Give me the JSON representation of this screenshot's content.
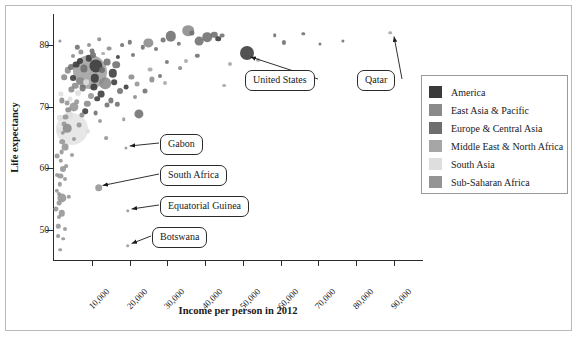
{
  "chart_data": {
    "type": "scatter",
    "title": "",
    "xlabel": "Income per person in 2012",
    "ylabel": "Life expectancy",
    "xlim": [
      0,
      98000
    ],
    "ylim": [
      45,
      85
    ],
    "xticks": [
      "10,000",
      "20,000",
      "30,000",
      "40,000",
      "50,000",
      "60,000",
      "70,000",
      "80,000",
      "90,000"
    ],
    "xtickvalues": [
      10000,
      20000,
      30000,
      40000,
      50000,
      60000,
      70000,
      80000,
      90000
    ],
    "yticks": [
      "50",
      "60",
      "70",
      "80"
    ],
    "ytickvalues": [
      50,
      60,
      70,
      80
    ],
    "grid": false,
    "legend_position": "right",
    "bubble_note": "marker area encodes population",
    "series": [
      {
        "name": "America",
        "color": "#3a3a3a"
      },
      {
        "name": "East Asia & Pacific",
        "color": "#8a8a8a"
      },
      {
        "name": "Europe & Central Asia",
        "color": "#6e6e6e"
      },
      {
        "name": "Middle East & North Africa",
        "color": "#a6a6a6"
      },
      {
        "name": "South Asia",
        "color": "#dedede"
      },
      {
        "name": "Sub-Saharan Africa",
        "color": "#949494"
      }
    ],
    "annotations": [
      {
        "label": "United States",
        "x": 51000,
        "y": 78.7
      },
      {
        "label": "Qatar",
        "x": 89000,
        "y": 82.0
      },
      {
        "label": "Gabon",
        "x": 19000,
        "y": 63.3
      },
      {
        "label": "South Africa",
        "x": 11800,
        "y": 56.9
      },
      {
        "label": "Equatorial Guinea",
        "x": 19500,
        "y": 53.1
      },
      {
        "label": "Botswana",
        "x": 19500,
        "y": 47.5
      }
    ],
    "points": [
      {
        "x": 51000,
        "y": 78.7,
        "r": 7.0,
        "s": 0
      },
      {
        "x": 89000,
        "y": 82.0,
        "r": 1.8,
        "s": 3
      },
      {
        "x": 19000,
        "y": 63.3,
        "r": 1.6,
        "s": 5
      },
      {
        "x": 11800,
        "y": 56.9,
        "r": 3.8,
        "s": 5
      },
      {
        "x": 19500,
        "y": 53.1,
        "r": 1.7,
        "s": 5
      },
      {
        "x": 19500,
        "y": 47.5,
        "r": 1.8,
        "s": 5
      },
      {
        "x": 9500,
        "y": 75.6,
        "r": 17.0,
        "s": 1
      },
      {
        "x": 4800,
        "y": 66.3,
        "r": 16.0,
        "s": 4
      },
      {
        "x": 11200,
        "y": 76.6,
        "r": 6.6,
        "s": 0
      },
      {
        "x": 5200,
        "y": 70.0,
        "r": 4.6,
        "s": 5
      },
      {
        "x": 3500,
        "y": 66.5,
        "r": 4.3,
        "s": 1
      },
      {
        "x": 4100,
        "y": 68.7,
        "r": 4.0,
        "s": 4
      },
      {
        "x": 22500,
        "y": 68.8,
        "r": 4.6,
        "s": 2
      },
      {
        "x": 2900,
        "y": 63.5,
        "r": 3.4,
        "s": 5
      },
      {
        "x": 2300,
        "y": 59.9,
        "r": 3.0,
        "s": 5
      },
      {
        "x": 2100,
        "y": 55.2,
        "r": 4.6,
        "s": 5
      },
      {
        "x": 2000,
        "y": 52.7,
        "r": 3.2,
        "s": 5
      },
      {
        "x": 13500,
        "y": 73.8,
        "r": 5.8,
        "s": 1
      },
      {
        "x": 15500,
        "y": 75.4,
        "r": 4.2,
        "s": 0
      },
      {
        "x": 16500,
        "y": 76.8,
        "r": 3.8,
        "s": 2
      },
      {
        "x": 25000,
        "y": 80.3,
        "r": 4.6,
        "s": 1
      },
      {
        "x": 31000,
        "y": 81.4,
        "r": 5.2,
        "s": 2
      },
      {
        "x": 35500,
        "y": 82.3,
        "r": 5.8,
        "s": 1
      },
      {
        "x": 38500,
        "y": 80.6,
        "r": 4.4,
        "s": 2
      },
      {
        "x": 40500,
        "y": 81.2,
        "r": 4.8,
        "s": 2
      },
      {
        "x": 42500,
        "y": 81.6,
        "r": 3.2,
        "s": 2
      },
      {
        "x": 43500,
        "y": 81.0,
        "r": 2.8,
        "s": 0
      },
      {
        "x": 44500,
        "y": 81.5,
        "r": 2.4,
        "s": 2
      },
      {
        "x": 36500,
        "y": 81.9,
        "r": 2.6,
        "s": 2
      },
      {
        "x": 33000,
        "y": 80.2,
        "r": 2.2,
        "s": 2
      },
      {
        "x": 29000,
        "y": 80.8,
        "r": 2.4,
        "s": 2
      },
      {
        "x": 27000,
        "y": 79.4,
        "r": 2.0,
        "s": 2
      },
      {
        "x": 23500,
        "y": 79.6,
        "r": 2.2,
        "s": 2
      },
      {
        "x": 21000,
        "y": 78.4,
        "r": 2.0,
        "s": 2
      },
      {
        "x": 20000,
        "y": 80.4,
        "r": 2.2,
        "s": 2
      },
      {
        "x": 18000,
        "y": 79.9,
        "r": 1.9,
        "s": 2
      },
      {
        "x": 17000,
        "y": 78.0,
        "r": 2.1,
        "s": 0
      },
      {
        "x": 14500,
        "y": 79.4,
        "r": 2.4,
        "s": 1
      },
      {
        "x": 13000,
        "y": 78.6,
        "r": 1.9,
        "s": 3
      },
      {
        "x": 12000,
        "y": 80.9,
        "r": 1.8,
        "s": 1
      },
      {
        "x": 1600,
        "y": 80.7,
        "r": 1.6,
        "s": 1
      },
      {
        "x": 61000,
        "y": 80.4,
        "r": 2.1,
        "s": 2
      },
      {
        "x": 58500,
        "y": 81.6,
        "r": 1.8,
        "s": 2
      },
      {
        "x": 66000,
        "y": 81.8,
        "r": 1.7,
        "s": 2
      },
      {
        "x": 54000,
        "y": 77.6,
        "r": 2.0,
        "s": 3
      },
      {
        "x": 53000,
        "y": 74.9,
        "r": 1.8,
        "s": 3
      },
      {
        "x": 70500,
        "y": 80.2,
        "r": 1.6,
        "s": 2
      },
      {
        "x": 76500,
        "y": 80.6,
        "r": 1.6,
        "s": 2
      },
      {
        "x": 46500,
        "y": 76.9,
        "r": 2.0,
        "s": 3
      },
      {
        "x": 38000,
        "y": 78.2,
        "r": 2.2,
        "s": 2
      },
      {
        "x": 35000,
        "y": 77.4,
        "r": 2.0,
        "s": 3
      },
      {
        "x": 33500,
        "y": 76.2,
        "r": 1.9,
        "s": 1
      },
      {
        "x": 30000,
        "y": 77.2,
        "r": 2.1,
        "s": 2
      },
      {
        "x": 28000,
        "y": 75.0,
        "r": 2.0,
        "s": 2
      },
      {
        "x": 26000,
        "y": 74.4,
        "r": 2.6,
        "s": 1
      },
      {
        "x": 24000,
        "y": 72.6,
        "r": 2.5,
        "s": 2
      },
      {
        "x": 22000,
        "y": 73.6,
        "r": 2.4,
        "s": 5
      },
      {
        "x": 20500,
        "y": 74.8,
        "r": 2.6,
        "s": 1
      },
      {
        "x": 19000,
        "y": 73.2,
        "r": 2.4,
        "s": 0
      },
      {
        "x": 17500,
        "y": 72.5,
        "r": 3.0,
        "s": 2
      },
      {
        "x": 16000,
        "y": 74.0,
        "r": 2.8,
        "s": 0
      },
      {
        "x": 15000,
        "y": 71.0,
        "r": 2.6,
        "s": 2
      },
      {
        "x": 14000,
        "y": 70.2,
        "r": 2.5,
        "s": 2
      },
      {
        "x": 12500,
        "y": 72.0,
        "r": 3.4,
        "s": 0
      },
      {
        "x": 11500,
        "y": 71.3,
        "r": 2.8,
        "s": 0
      },
      {
        "x": 10500,
        "y": 73.2,
        "r": 3.6,
        "s": 0
      },
      {
        "x": 9800,
        "y": 71.8,
        "r": 3.0,
        "s": 5
      },
      {
        "x": 8800,
        "y": 70.5,
        "r": 3.2,
        "s": 1
      },
      {
        "x": 8200,
        "y": 69.3,
        "r": 2.8,
        "s": 0
      },
      {
        "x": 7600,
        "y": 73.0,
        "r": 3.4,
        "s": 2
      },
      {
        "x": 7000,
        "y": 74.2,
        "r": 3.8,
        "s": 1
      },
      {
        "x": 6400,
        "y": 72.2,
        "r": 3.0,
        "s": 4
      },
      {
        "x": 6000,
        "y": 70.8,
        "r": 2.8,
        "s": 5
      },
      {
        "x": 5600,
        "y": 73.4,
        "r": 3.2,
        "s": 1
      },
      {
        "x": 5000,
        "y": 74.6,
        "r": 3.0,
        "s": 0
      },
      {
        "x": 4600,
        "y": 72.8,
        "r": 2.6,
        "s": 1
      },
      {
        "x": 4200,
        "y": 71.2,
        "r": 2.4,
        "s": 4
      },
      {
        "x": 3800,
        "y": 69.5,
        "r": 2.8,
        "s": 1
      },
      {
        "x": 3400,
        "y": 70.6,
        "r": 2.4,
        "s": 5
      },
      {
        "x": 3000,
        "y": 68.4,
        "r": 2.6,
        "s": 5
      },
      {
        "x": 2600,
        "y": 67.2,
        "r": 2.4,
        "s": 5
      },
      {
        "x": 2400,
        "y": 65.8,
        "r": 2.2,
        "s": 5
      },
      {
        "x": 2200,
        "y": 64.3,
        "r": 2.8,
        "s": 5
      },
      {
        "x": 2000,
        "y": 62.6,
        "r": 2.4,
        "s": 5
      },
      {
        "x": 1800,
        "y": 61.2,
        "r": 2.2,
        "s": 5
      },
      {
        "x": 1700,
        "y": 58.8,
        "r": 2.6,
        "s": 5
      },
      {
        "x": 1500,
        "y": 57.4,
        "r": 2.2,
        "s": 5
      },
      {
        "x": 1400,
        "y": 55.8,
        "r": 2.0,
        "s": 5
      },
      {
        "x": 1300,
        "y": 54.4,
        "r": 2.4,
        "s": 5
      },
      {
        "x": 1200,
        "y": 52.2,
        "r": 2.0,
        "s": 5
      },
      {
        "x": 1100,
        "y": 50.6,
        "r": 2.2,
        "s": 5
      },
      {
        "x": 1000,
        "y": 49.0,
        "r": 1.9,
        "s": 5
      },
      {
        "x": 1600,
        "y": 46.8,
        "r": 1.8,
        "s": 5
      },
      {
        "x": 3600,
        "y": 75.9,
        "r": 3.2,
        "s": 1
      },
      {
        "x": 4400,
        "y": 76.4,
        "r": 3.0,
        "s": 2
      },
      {
        "x": 5800,
        "y": 76.8,
        "r": 3.4,
        "s": 0
      },
      {
        "x": 6800,
        "y": 77.4,
        "r": 3.0,
        "s": 0
      },
      {
        "x": 8000,
        "y": 76.2,
        "r": 3.6,
        "s": 2
      },
      {
        "x": 9200,
        "y": 77.8,
        "r": 3.2,
        "s": 0
      },
      {
        "x": 10200,
        "y": 78.4,
        "r": 3.0,
        "s": 2
      },
      {
        "x": 7200,
        "y": 78.9,
        "r": 2.6,
        "s": 1
      },
      {
        "x": 6200,
        "y": 79.6,
        "r": 2.2,
        "s": 2
      },
      {
        "x": 10800,
        "y": 74.6,
        "r": 4.2,
        "s": 0
      },
      {
        "x": 12800,
        "y": 76.0,
        "r": 3.0,
        "s": 2
      },
      {
        "x": 8600,
        "y": 74.0,
        "r": 2.8,
        "s": 4
      },
      {
        "x": 7400,
        "y": 68.6,
        "r": 2.6,
        "s": 1
      },
      {
        "x": 6600,
        "y": 67.0,
        "r": 2.4,
        "s": 5
      },
      {
        "x": 9000,
        "y": 66.0,
        "r": 2.2,
        "s": 4
      },
      {
        "x": 5400,
        "y": 64.8,
        "r": 2.0,
        "s": 5
      },
      {
        "x": 4800,
        "y": 62.2,
        "r": 2.0,
        "s": 5
      },
      {
        "x": 3200,
        "y": 60.4,
        "r": 1.9,
        "s": 5
      },
      {
        "x": 2800,
        "y": 58.2,
        "r": 2.0,
        "s": 5
      },
      {
        "x": 4000,
        "y": 55.4,
        "r": 2.2,
        "s": 5
      },
      {
        "x": 3000,
        "y": 50.2,
        "r": 2.0,
        "s": 5
      },
      {
        "x": 2400,
        "y": 48.6,
        "r": 1.8,
        "s": 5
      },
      {
        "x": 1900,
        "y": 72.0,
        "r": 2.6,
        "s": 4
      },
      {
        "x": 1500,
        "y": 68.2,
        "r": 3.2,
        "s": 4
      },
      {
        "x": 1250,
        "y": 66.0,
        "r": 2.4,
        "s": 4
      },
      {
        "x": 900,
        "y": 62.0,
        "r": 2.4,
        "s": 5
      },
      {
        "x": 800,
        "y": 59.0,
        "r": 2.0,
        "s": 5
      },
      {
        "x": 700,
        "y": 56.4,
        "r": 2.2,
        "s": 5
      },
      {
        "x": 600,
        "y": 53.5,
        "r": 2.6,
        "s": 5
      },
      {
        "x": 2700,
        "y": 74.8,
        "r": 2.8,
        "s": 1
      },
      {
        "x": 2200,
        "y": 71.0,
        "r": 2.6,
        "s": 1
      },
      {
        "x": 14000,
        "y": 77.2,
        "r": 3.4,
        "s": 2
      },
      {
        "x": 11000,
        "y": 69.0,
        "r": 2.4,
        "s": 2
      },
      {
        "x": 12200,
        "y": 67.6,
        "r": 2.0,
        "s": 5
      },
      {
        "x": 16800,
        "y": 70.4,
        "r": 2.2,
        "s": 2
      },
      {
        "x": 13800,
        "y": 64.9,
        "r": 1.9,
        "s": 5
      },
      {
        "x": 25500,
        "y": 76.0,
        "r": 2.4,
        "s": 3
      },
      {
        "x": 29500,
        "y": 73.8,
        "r": 2.0,
        "s": 3
      },
      {
        "x": 21500,
        "y": 71.5,
        "r": 2.0,
        "s": 1
      },
      {
        "x": 18500,
        "y": 68.0,
        "r": 1.8,
        "s": 5
      },
      {
        "x": 45000,
        "y": 73.4,
        "r": 1.9,
        "s": 3
      },
      {
        "x": 10000,
        "y": 79.0,
        "r": 2.4,
        "s": 2
      },
      {
        "x": 9400,
        "y": 80.0,
        "r": 2.0,
        "s": 1
      },
      {
        "x": 5000,
        "y": 78.2,
        "r": 2.0,
        "s": 1
      }
    ]
  },
  "legend": {
    "items": [
      {
        "label": "America",
        "color": "#3a3a3a"
      },
      {
        "label": "East Asia & Pacific",
        "color": "#8a8a8a"
      },
      {
        "label": "Europe & Central Asia",
        "color": "#6e6e6e"
      },
      {
        "label": "Middle East & North Africa",
        "color": "#a6a6a6"
      },
      {
        "label": "South Asia",
        "color": "#dedede"
      },
      {
        "label": "Sub-Saharan Africa",
        "color": "#949494"
      }
    ]
  }
}
